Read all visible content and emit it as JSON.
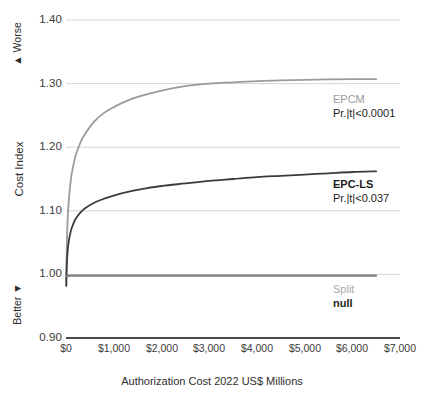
{
  "chart_data": {
    "type": "line",
    "title": "",
    "xlabel": "Authorization Cost 2022 US$ Millions",
    "ylabel": "Cost Index",
    "xlim": [
      0,
      7000
    ],
    "ylim": [
      0.9,
      1.4
    ],
    "grid": true,
    "legend_position": "inline-right-annotations",
    "xticks": [
      "$0",
      "$1,000",
      "$2,000",
      "$3,000",
      "$4,000",
      "$5,000",
      "$6,000",
      "$7,000"
    ],
    "xtick_values": [
      0,
      1000,
      2000,
      3000,
      4000,
      5000,
      6000,
      7000
    ],
    "yticks": [
      "0.90",
      "1.00",
      "1.10",
      "1.20",
      "1.30",
      "1.40"
    ],
    "ytick_values": [
      0.9,
      1.0,
      1.1,
      1.2,
      1.3,
      1.4
    ],
    "direction_labels": {
      "top": "Worse",
      "bottom": "Better",
      "up_arrow": "▲",
      "down_arrow": "▼"
    },
    "series": [
      {
        "name": "EPCM",
        "stat": "Pr.|t|<0.0001",
        "color": "#9b9b9b",
        "x": [
          5,
          20,
          50,
          100,
          150,
          200,
          300,
          400,
          600,
          800,
          1000,
          1250,
          1500,
          2000,
          2500,
          3000,
          3500,
          4000,
          4500,
          5000,
          5500,
          6000,
          6500
        ],
        "values": [
          0.982,
          1.055,
          1.108,
          1.148,
          1.17,
          1.186,
          1.207,
          1.221,
          1.241,
          1.254,
          1.263,
          1.272,
          1.279,
          1.289,
          1.296,
          1.3,
          1.302,
          1.304,
          1.305,
          1.306,
          1.3065,
          1.307,
          1.307
        ]
      },
      {
        "name": "EPC-LS",
        "stat": "Pr.|t|<0.037",
        "color": "#3c3c3c",
        "x": [
          5,
          20,
          50,
          100,
          150,
          200,
          300,
          400,
          600,
          800,
          1000,
          1250,
          1500,
          2000,
          2500,
          3000,
          3500,
          4000,
          4500,
          5000,
          5500,
          6000,
          6500
        ],
        "values": [
          0.982,
          1.02,
          1.048,
          1.068,
          1.079,
          1.087,
          1.097,
          1.104,
          1.113,
          1.119,
          1.124,
          1.129,
          1.133,
          1.139,
          1.143,
          1.147,
          1.15,
          1.153,
          1.155,
          1.157,
          1.159,
          1.161,
          1.162
        ]
      },
      {
        "name": "Split",
        "stat": "null",
        "color": "#808080",
        "x": [
          5,
          100,
          500,
          1000,
          2000,
          3000,
          4000,
          5000,
          6000,
          6500
        ],
        "values": [
          0.997,
          0.998,
          0.998,
          0.998,
          0.998,
          0.998,
          0.998,
          0.998,
          0.998,
          0.998
        ]
      }
    ],
    "baseline_value": 0.9
  },
  "axes": {
    "y_title": "Cost Index",
    "x_title": "Authorization Cost 2022 US$ Millions",
    "worse_label": "Worse",
    "better_label": "Better",
    "up_arrow": "▲",
    "down_arrow": "▼",
    "yticks": [
      {
        "label": "1.40"
      },
      {
        "label": "1.30"
      },
      {
        "label": "1.20"
      },
      {
        "label": "1.10"
      },
      {
        "label": "1.00"
      },
      {
        "label": "0.90"
      }
    ],
    "xticks": [
      {
        "label": "$0"
      },
      {
        "label": "$1,000"
      },
      {
        "label": "$2,000"
      },
      {
        "label": "$3,000"
      },
      {
        "label": "$4,000"
      },
      {
        "label": "$5,000"
      },
      {
        "label": "$6,000"
      },
      {
        "label": "$7,000"
      }
    ]
  },
  "annotations": {
    "epcm": {
      "name": "EPCM",
      "stat": "Pr.|t|<0.0001"
    },
    "epcls": {
      "name": "EPC-LS",
      "stat": "Pr.|t|<0.037"
    },
    "split": {
      "name": "Split",
      "stat": "null"
    }
  },
  "colors": {
    "epcm": "#9b9b9b",
    "epcls": "#3c3c3c",
    "split": "#808080",
    "gridline": "#d6d6d6",
    "baseline": "#4a4a4a",
    "text": "#2e2e2e"
  }
}
